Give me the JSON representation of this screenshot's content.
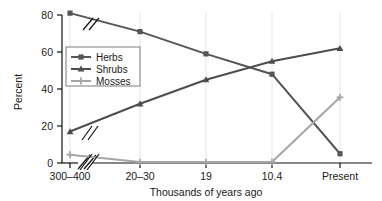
{
  "chart_data": {
    "type": "line",
    "title": "",
    "xlabel": "Thousands of years ago",
    "ylabel": "Percent",
    "categories": [
      "300–400",
      "20–30",
      "19",
      "10.4",
      "Present"
    ],
    "ylim": [
      0,
      80
    ],
    "yticks": [
      0,
      20,
      40,
      60,
      80
    ],
    "grid": "vertical-only",
    "axis_break": true,
    "axis_break_note": "Diagonal break marks (//) after the first category on the x-axis and on all three series lines",
    "legend_position": "upper-left-inside",
    "series": [
      {
        "name": "Herbs",
        "marker": "square",
        "color": "#555555",
        "values": [
          81,
          71,
          59,
          48,
          5
        ]
      },
      {
        "name": "Shrubs",
        "marker": "triangle",
        "color": "#4d4d4d",
        "values": [
          17,
          32,
          45,
          55,
          62
        ]
      },
      {
        "name": "Mosses",
        "marker": "plus",
        "color": "#a6a6a6",
        "values": [
          4.5,
          0.5,
          0.5,
          0.5,
          35.5
        ]
      }
    ]
  },
  "axes": {
    "y_tick_labels": [
      "80",
      "60",
      "40",
      "20",
      "0"
    ],
    "x_tick_labels": [
      "300–400",
      "20–30",
      "19",
      "10.4",
      "Present"
    ],
    "y_axis_title": "Percent",
    "x_axis_title": "Thousands of years ago"
  },
  "legend": {
    "items": [
      {
        "label": "Herbs",
        "marker": "square-marker"
      },
      {
        "label": "Shrubs",
        "marker": "triangle-marker"
      },
      {
        "label": "Mosses",
        "marker": "plus-marker"
      }
    ]
  },
  "colors": {
    "herbs": "#555555",
    "shrubs": "#4d4d4d",
    "mosses": "#a6a6a6",
    "axis": "#111111",
    "gridline": "#e2e2e2",
    "text": "#1a1a1a"
  }
}
